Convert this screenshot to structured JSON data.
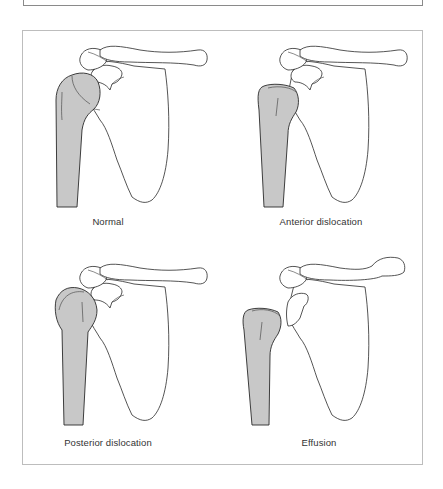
{
  "figure": {
    "panels": [
      {
        "id": "normal",
        "label": "Normal"
      },
      {
        "id": "anterior",
        "label": "Anterior dislocation"
      },
      {
        "id": "posterior",
        "label": "Posterior dislocation"
      },
      {
        "id": "effusion",
        "label": "Effusion"
      }
    ]
  },
  "colors": {
    "humerus_fill": "#c8c8c8",
    "outline": "#2a2a2a",
    "frame": "#bdbdbd"
  }
}
